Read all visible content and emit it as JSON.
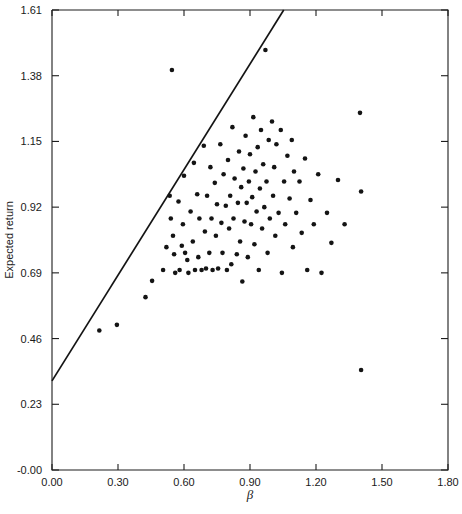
{
  "chart_data": {
    "type": "scatter",
    "title": "",
    "xlabel": "β",
    "ylabel": "Expected return",
    "xlim": [
      0.0,
      1.8
    ],
    "ylim": [
      -0.0,
      1.61
    ],
    "xticks": [
      "0.00",
      "0.30",
      "0.60",
      "0.90",
      "1.20",
      "1.50",
      "1.80"
    ],
    "xtick_values": [
      0.0,
      0.3,
      0.6,
      0.9,
      1.2,
      1.5,
      1.8
    ],
    "yticks": [
      "-0.00",
      "0.23",
      "0.46",
      "0.69",
      "0.92",
      "1.15",
      "1.38",
      "1.61"
    ],
    "ytick_values": [
      0.0,
      0.23,
      0.46,
      0.69,
      0.92,
      1.15,
      1.38,
      1.61
    ],
    "grid": false,
    "legend": null,
    "point_color": "#141414",
    "line_color": "#141414",
    "fit_line": {
      "label": "security market line",
      "x": [
        0.0,
        1.8
      ],
      "y": [
        0.312,
        2.53
      ],
      "intercept": 0.312,
      "slope": 1.232,
      "clipped_to_axes": true
    },
    "points": [
      [
        0.215,
        0.488
      ],
      [
        0.295,
        0.508
      ],
      [
        0.425,
        0.605
      ],
      [
        0.455,
        0.662
      ],
      [
        0.505,
        0.7
      ],
      [
        0.52,
        0.78
      ],
      [
        0.535,
        0.96
      ],
      [
        0.54,
        0.88
      ],
      [
        0.545,
        1.4
      ],
      [
        0.55,
        0.82
      ],
      [
        0.555,
        0.755
      ],
      [
        0.56,
        0.69
      ],
      [
        0.575,
        0.94
      ],
      [
        0.58,
        0.7
      ],
      [
        0.59,
        0.785
      ],
      [
        0.595,
        0.86
      ],
      [
        0.6,
        1.03
      ],
      [
        0.605,
        0.76
      ],
      [
        0.615,
        0.735
      ],
      [
        0.62,
        0.69
      ],
      [
        0.63,
        0.905
      ],
      [
        0.64,
        0.8
      ],
      [
        0.645,
        1.075
      ],
      [
        0.65,
        0.7
      ],
      [
        0.66,
        0.965
      ],
      [
        0.665,
        0.745
      ],
      [
        0.67,
        0.88
      ],
      [
        0.68,
        0.7
      ],
      [
        0.69,
        1.135
      ],
      [
        0.695,
        0.835
      ],
      [
        0.7,
        0.705
      ],
      [
        0.705,
        0.96
      ],
      [
        0.715,
        0.76
      ],
      [
        0.72,
        1.06
      ],
      [
        0.725,
        0.88
      ],
      [
        0.73,
        0.7
      ],
      [
        0.74,
        1.005
      ],
      [
        0.745,
        0.82
      ],
      [
        0.75,
        0.93
      ],
      [
        0.755,
        0.705
      ],
      [
        0.765,
        1.14
      ],
      [
        0.77,
        0.865
      ],
      [
        0.775,
        0.76
      ],
      [
        0.78,
        1.035
      ],
      [
        0.79,
        0.925
      ],
      [
        0.795,
        0.7
      ],
      [
        0.8,
        1.085
      ],
      [
        0.805,
        0.845
      ],
      [
        0.81,
        0.96
      ],
      [
        0.815,
        0.72
      ],
      [
        0.82,
        1.2
      ],
      [
        0.825,
        0.88
      ],
      [
        0.83,
        1.02
      ],
      [
        0.84,
        0.755
      ],
      [
        0.845,
        0.935
      ],
      [
        0.85,
        1.115
      ],
      [
        0.855,
        0.8
      ],
      [
        0.86,
        0.99
      ],
      [
        0.865,
        0.66
      ],
      [
        0.87,
        1.055
      ],
      [
        0.875,
        0.87
      ],
      [
        0.88,
        1.17
      ],
      [
        0.885,
        0.935
      ],
      [
        0.89,
        0.745
      ],
      [
        0.895,
        1.01
      ],
      [
        0.9,
        1.105
      ],
      [
        0.905,
        0.86
      ],
      [
        0.91,
        0.955
      ],
      [
        0.915,
        1.235
      ],
      [
        0.92,
        0.79
      ],
      [
        0.925,
        1.045
      ],
      [
        0.93,
        0.905
      ],
      [
        0.935,
        1.13
      ],
      [
        0.94,
        0.7
      ],
      [
        0.945,
        0.985
      ],
      [
        0.95,
        1.19
      ],
      [
        0.955,
        0.845
      ],
      [
        0.96,
        1.07
      ],
      [
        0.965,
        0.92
      ],
      [
        0.97,
        1.47
      ],
      [
        0.975,
        1.01
      ],
      [
        0.98,
        0.76
      ],
      [
        0.985,
        1.155
      ],
      [
        0.99,
        0.88
      ],
      [
        1.0,
        1.22
      ],
      [
        1.005,
        0.96
      ],
      [
        1.01,
        1.06
      ],
      [
        1.015,
        0.82
      ],
      [
        1.02,
        1.14
      ],
      [
        1.03,
        0.9
      ],
      [
        1.04,
        1.19
      ],
      [
        1.045,
        0.69
      ],
      [
        1.055,
        1.01
      ],
      [
        1.06,
        0.86
      ],
      [
        1.07,
        1.1
      ],
      [
        1.08,
        0.95
      ],
      [
        1.09,
        1.155
      ],
      [
        1.095,
        0.78
      ],
      [
        1.1,
        1.045
      ],
      [
        1.11,
        0.9
      ],
      [
        1.125,
        1.01
      ],
      [
        1.135,
        0.83
      ],
      [
        1.15,
        1.09
      ],
      [
        1.16,
        0.7
      ],
      [
        1.175,
        0.945
      ],
      [
        1.19,
        0.86
      ],
      [
        1.21,
        1.035
      ],
      [
        1.225,
        0.69
      ],
      [
        1.25,
        0.9
      ],
      [
        1.27,
        0.795
      ],
      [
        1.3,
        1.015
      ],
      [
        1.33,
        0.86
      ],
      [
        1.4,
        1.25
      ],
      [
        1.405,
        0.975
      ],
      [
        1.405,
        0.35
      ]
    ],
    "n_points": 115,
    "annotations": [
      {
        "text": "high outlier",
        "x": 0.545,
        "y": 1.4
      },
      {
        "text": "high outlier",
        "x": 0.97,
        "y": 1.47
      },
      {
        "text": "low outlier",
        "x": 1.405,
        "y": 0.35
      }
    ]
  },
  "geometry": {
    "plot_left": 52,
    "plot_right": 448,
    "plot_top": 10,
    "plot_bottom": 470
  }
}
